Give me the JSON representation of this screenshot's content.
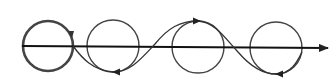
{
  "diagram": {
    "stroke_color": "#333333",
    "axis": {
      "x1": 20,
      "y1": 46,
      "x2": 330,
      "y2": 48
    },
    "circles": [
      {
        "cx": 48,
        "cy": 46,
        "r": 25,
        "emphasized": true
      },
      {
        "cx": 113,
        "cy": 46,
        "r": 26,
        "emphasized": false
      },
      {
        "cx": 198,
        "cy": 47,
        "r": 26,
        "emphasized": false
      },
      {
        "cx": 276,
        "cy": 48,
        "r": 26,
        "emphasized": false
      }
    ]
  }
}
